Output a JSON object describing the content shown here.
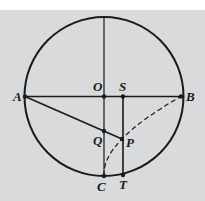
{
  "diagram": {
    "colors": {
      "background": "#d9dadb",
      "ink": "#1a1a1a"
    },
    "circle": {
      "cx": 104,
      "cy": 96.5,
      "r": 79.5
    },
    "points": {
      "A": {
        "x": 25,
        "y": 96.5,
        "label": "A",
        "lx": 13,
        "ly": 101
      },
      "B": {
        "x": 181,
        "y": 96.5,
        "label": "B",
        "lx": 186,
        "ly": 101
      },
      "O": {
        "x": 104,
        "y": 96.5,
        "label": "O",
        "lx": 93,
        "ly": 91
      },
      "S": {
        "x": 123,
        "y": 96.5,
        "label": "S",
        "lx": 119,
        "ly": 91
      },
      "Q": {
        "x": 104,
        "y": 131,
        "label": "Q",
        "lx": 93,
        "ly": 145
      },
      "P": {
        "x": 122,
        "y": 139,
        "label": "P",
        "lx": 126,
        "ly": 147
      },
      "C": {
        "x": 104,
        "y": 176,
        "label": "C",
        "lx": 97,
        "ly": 191
      },
      "T": {
        "x": 123,
        "y": 175,
        "label": "T",
        "lx": 119,
        "ly": 189
      }
    },
    "segments": [
      {
        "name": "diameter-AB",
        "from": "A",
        "to": "B"
      },
      {
        "name": "radius-top-to-C",
        "x1": 104,
        "y1": 17,
        "x2": 104,
        "y2": 176
      },
      {
        "name": "segment-AP",
        "from": "A",
        "to": "P"
      },
      {
        "name": "segment-ST",
        "from": "S",
        "to": "T"
      }
    ],
    "dashed_curve": {
      "name": "curve-CPB",
      "d": "M104,176 Q101.5,141.5 181,96.5"
    }
  }
}
